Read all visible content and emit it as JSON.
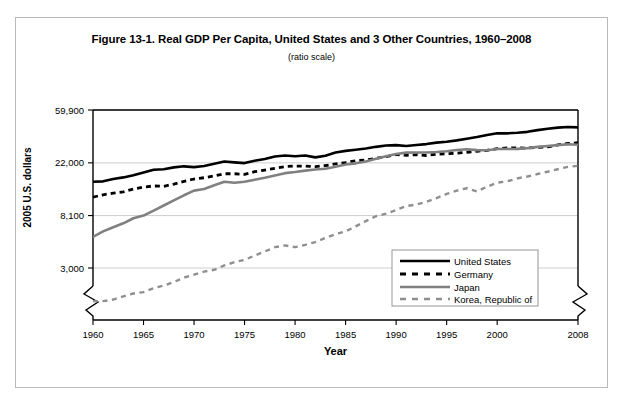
{
  "figure": {
    "title": "Figure 13-1. Real GDP Per Capita, United States and 3 Other Countries, 1960–2008",
    "subtitle": "(ratio scale)"
  },
  "chart_data": {
    "type": "line",
    "title": "Figure 13-1. Real GDP Per Capita, United States and 3 Other Countries, 1960–2008",
    "subtitle": "(ratio scale)",
    "xlabel": "Year",
    "ylabel": "2005 U.S. dollars",
    "scale": "log",
    "grid": true,
    "legend_position": "inside bottom-right",
    "axis_break": true,
    "xlim": [
      1960,
      2008
    ],
    "ylim": [
      1500,
      59900
    ],
    "ytick_labels": [
      "59,900",
      "22,000",
      "8,100",
      "3,000"
    ],
    "ytick_values": [
      59900,
      22000,
      8100,
      3000
    ],
    "xtick_labels": [
      "1960",
      "1965",
      "1970",
      "1975",
      "1980",
      "1985",
      "1990",
      "1995",
      "2000",
      "2008"
    ],
    "xtick_values": [
      1960,
      1965,
      1970,
      1975,
      1980,
      1985,
      1990,
      1995,
      2000,
      2008
    ],
    "x": [
      1960,
      1961,
      1962,
      1963,
      1964,
      1965,
      1966,
      1967,
      1968,
      1969,
      1970,
      1971,
      1972,
      1973,
      1974,
      1975,
      1976,
      1977,
      1978,
      1979,
      1980,
      1981,
      1982,
      1983,
      1984,
      1985,
      1986,
      1987,
      1988,
      1989,
      1990,
      1991,
      1992,
      1993,
      1994,
      1995,
      1996,
      1997,
      1998,
      1999,
      2000,
      2001,
      2002,
      2003,
      2004,
      2005,
      2006,
      2007,
      2008
    ],
    "series": [
      {
        "name": "United States",
        "color": "#000000",
        "style": "solid",
        "width": 2.6,
        "values": [
          15400,
          15500,
          16200,
          16700,
          17400,
          18300,
          19300,
          19500,
          20200,
          20600,
          20300,
          20700,
          21600,
          22600,
          22200,
          21900,
          22900,
          23700,
          24800,
          25300,
          24900,
          25300,
          24400,
          25200,
          26800,
          27600,
          28200,
          28900,
          29800,
          30600,
          30800,
          30300,
          30900,
          31400,
          32300,
          32800,
          33700,
          34800,
          35900,
          37300,
          38500,
          38500,
          38900,
          39600,
          40900,
          42000,
          42900,
          43400,
          43100
        ]
      },
      {
        "name": "Germany",
        "color": "#000000",
        "style": "dashed",
        "width": 2.8,
        "values": [
          11500,
          12000,
          12400,
          12700,
          13400,
          13900,
          14200,
          14100,
          14700,
          15500,
          16200,
          16600,
          17200,
          17900,
          17900,
          17700,
          18600,
          19200,
          19800,
          20500,
          20700,
          20700,
          20500,
          20900,
          21600,
          22100,
          22900,
          23200,
          24000,
          24700,
          25800,
          25400,
          25700,
          25300,
          25900,
          26200,
          26400,
          26900,
          27400,
          27900,
          28800,
          29200,
          29200,
          29100,
          29500,
          29800,
          30900,
          31800,
          32200
        ]
      },
      {
        "name": "Japan",
        "color": "#808080",
        "style": "solid",
        "width": 2.6,
        "values": [
          5400,
          6000,
          6500,
          7000,
          7700,
          8100,
          8900,
          9800,
          10800,
          11900,
          13000,
          13400,
          14400,
          15400,
          15100,
          15400,
          16000,
          16600,
          17300,
          18100,
          18500,
          19000,
          19400,
          19700,
          20400,
          21300,
          21800,
          22600,
          23800,
          24900,
          26000,
          26700,
          26800,
          26800,
          27000,
          27400,
          28100,
          28500,
          28000,
          27900,
          28600,
          28600,
          28700,
          29100,
          29800,
          30300,
          30800,
          31300,
          31000
        ]
      },
      {
        "name": "Korea, Republic of",
        "color": "#8f8f8f",
        "style": "dashed",
        "width": 2.4,
        "values": [
          1600,
          1600,
          1650,
          1750,
          1850,
          1900,
          2050,
          2150,
          2300,
          2500,
          2650,
          2800,
          2900,
          3150,
          3350,
          3500,
          3800,
          4100,
          4450,
          4600,
          4450,
          4650,
          4900,
          5300,
          5700,
          6000,
          6600,
          7300,
          8000,
          8400,
          9000,
          9700,
          10000,
          10500,
          11300,
          12200,
          13000,
          13600,
          12800,
          14000,
          15100,
          15500,
          16400,
          17000,
          17800,
          18600,
          19500,
          20400,
          20800
        ]
      }
    ]
  },
  "legend": {
    "items": [
      {
        "label": "United States",
        "swatch": "solid-black-line"
      },
      {
        "label": "Germany",
        "swatch": "dashed-black-line"
      },
      {
        "label": "Japan",
        "swatch": "solid-gray-line"
      },
      {
        "label": "Korea, Republic of",
        "swatch": "dashed-gray-line"
      }
    ]
  }
}
